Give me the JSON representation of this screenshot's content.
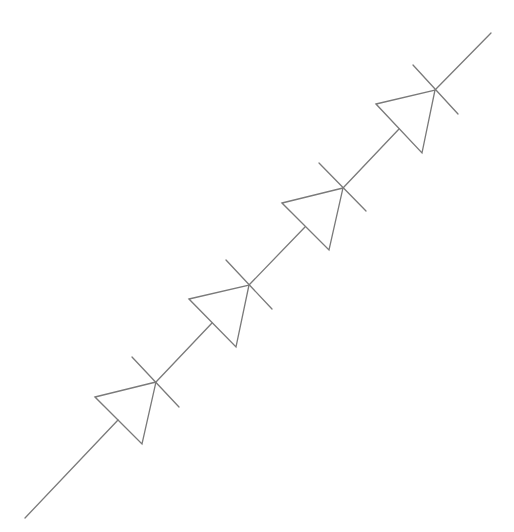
{
  "diagram": {
    "stroke_color": "#7a7a7a",
    "background": "#ffffff",
    "wire_start": [
      25,
      518
    ],
    "wire_end": [
      491,
      33
    ],
    "diodes": [
      {
        "id": "D1",
        "triangle": [
          [
            95,
            397
          ],
          [
            156,
            382
          ],
          [
            142,
            444
          ]
        ],
        "anode": [
          118,
          420
        ],
        "cathode": [
          156,
          382
        ],
        "bar": [
          [
            132,
            357
          ],
          [
            179,
            407
          ]
        ]
      },
      {
        "id": "D2",
        "triangle": [
          [
            189,
            299
          ],
          [
            249,
            285
          ],
          [
            236,
            347
          ]
        ],
        "anode": [
          212,
          323
        ],
        "cathode": [
          249,
          285
        ],
        "bar": [
          [
            226,
            260
          ],
          [
            272,
            309
          ]
        ]
      },
      {
        "id": "D3",
        "triangle": [
          [
            282,
            203
          ],
          [
            343,
            188
          ],
          [
            329,
            250
          ]
        ],
        "anode": [
          305,
          227
        ],
        "cathode": [
          343,
          188
        ],
        "bar": [
          [
            319,
            163
          ],
          [
            366,
            211
          ]
        ]
      },
      {
        "id": "D4",
        "triangle": [
          [
            376,
            104
          ],
          [
            435,
            90
          ],
          [
            422,
            153
          ]
        ],
        "anode": [
          399,
          129
        ],
        "cathode": [
          435,
          90
        ],
        "bar": [
          [
            413,
            65
          ],
          [
            458,
            114
          ]
        ]
      }
    ]
  }
}
